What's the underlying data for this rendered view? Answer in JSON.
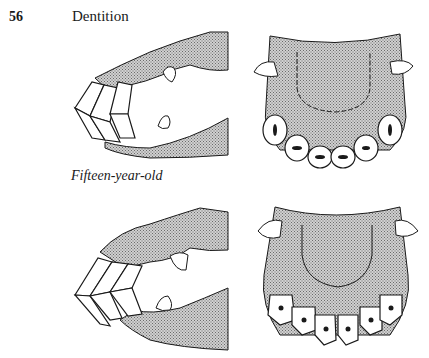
{
  "page": {
    "page_number": "56",
    "running_head": "Dentition"
  },
  "figures": {
    "caption_fifteen": "Fifteen-year-old",
    "items": [
      {
        "id": "upper-side-view",
        "subject": "side view of incisors (younger age)"
      },
      {
        "id": "upper-occlusal-view",
        "subject": "occlusal view of upper incisors (younger age)"
      },
      {
        "id": "lower-side-view",
        "subject": "side view of incisors, fifteen-year-old"
      },
      {
        "id": "lower-occlusal-view",
        "subject": "occlusal view of upper incisors, fifteen-year-old"
      }
    ]
  },
  "colors": {
    "ink": "#1a1a1a",
    "shade": "#b8b8b8",
    "paper": "#ffffff"
  }
}
